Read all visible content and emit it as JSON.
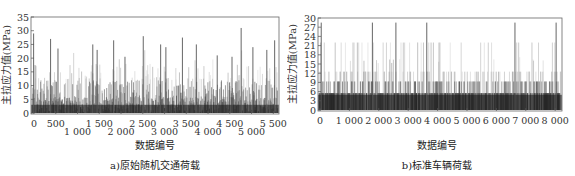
{
  "chart_data": [
    {
      "type": "bar",
      "title": "a)原始随机交通荷载",
      "xlabel": "数据编号",
      "ylabel": "主拉应力值(MPa)",
      "xlim": [
        0,
        5700
      ],
      "ylim": [
        0,
        35
      ],
      "yticks": [
        0,
        5,
        10,
        15,
        20,
        25,
        30,
        35
      ],
      "xticks_upper": [
        "0",
        "500",
        "1 500",
        "2 500",
        "3 500",
        "4 500",
        "5 500"
      ],
      "xticks_lower": [
        "1 000",
        "2 000",
        "3 000",
        "4 000",
        "5 000"
      ],
      "grid": false,
      "description": "Dense vertical spike series of principal tensile stress, mostly 0-15 MPa with peaks up to ~31 MPa",
      "peaks": [
        {
          "x": 60,
          "y": 29
        },
        {
          "x": 450,
          "y": 27
        },
        {
          "x": 620,
          "y": 23.5
        },
        {
          "x": 1420,
          "y": 25
        },
        {
          "x": 1520,
          "y": 23
        },
        {
          "x": 1900,
          "y": 26.5
        },
        {
          "x": 2160,
          "y": 20.5
        },
        {
          "x": 2580,
          "y": 28
        },
        {
          "x": 2980,
          "y": 25
        },
        {
          "x": 3100,
          "y": 24
        },
        {
          "x": 3480,
          "y": 27.5
        },
        {
          "x": 3800,
          "y": 25
        },
        {
          "x": 4280,
          "y": 21
        },
        {
          "x": 4620,
          "y": 20.5
        },
        {
          "x": 4830,
          "y": 31
        },
        {
          "x": 5100,
          "y": 24
        },
        {
          "x": 5420,
          "y": 23
        },
        {
          "x": 5600,
          "y": 26.5
        }
      ]
    },
    {
      "type": "bar",
      "title": "b)标准车辆荷载",
      "xlabel": "数据编号",
      "ylabel": "主拉应力值(MPa)",
      "xlim": [
        0,
        8300
      ],
      "ylim": [
        0,
        30
      ],
      "yticks": [
        0,
        3,
        6,
        9,
        12,
        15,
        18,
        21,
        24,
        27,
        30
      ],
      "xticks": [
        "0",
        "1 000",
        "2 000",
        "3 000",
        "4 000",
        "5 000",
        "6 000",
        "7 000",
        "8 000"
      ],
      "grid": false,
      "description": "Discrete stress levels: dense base near 5.5 MPa, frequent bands at ~9 and ~12.5 MPa, spikes to ~22 MPa and occasional peaks ~28.5 MPa",
      "levels": [
        5.5,
        9.3,
        12.5,
        22,
        28.5
      ],
      "peaks": [
        {
          "x": 110,
          "y": 28.5
        },
        {
          "x": 1850,
          "y": 28.5
        },
        {
          "x": 2650,
          "y": 28.5
        },
        {
          "x": 3700,
          "y": 28.5
        },
        {
          "x": 6700,
          "y": 28.5
        },
        {
          "x": 8100,
          "y": 28.5
        }
      ]
    }
  ],
  "panels": {
    "a": {
      "caption": "a)原始随机交通荷载",
      "xlabel": "数据编号",
      "ylabel": "主拉应力值(MPa)"
    },
    "b": {
      "caption": "b)标准车辆荷载",
      "xlabel": "数据编号",
      "ylabel": "主拉应力值(MPa)"
    }
  }
}
